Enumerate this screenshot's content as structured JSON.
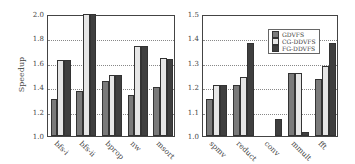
{
  "chart_data": [
    {
      "type": "bar",
      "title": "",
      "xlabel": "",
      "ylabel": "Speedup",
      "ylim": [
        1.0,
        2.0
      ],
      "yticks": [
        "1.0",
        "1.2",
        "1.4",
        "1.6",
        "1.8",
        "2.0"
      ],
      "grid": true,
      "categories": [
        "bfs-i",
        "bfs-ii",
        "bprop",
        "nw",
        "msort"
      ],
      "series": [
        {
          "name": "GDVFS",
          "color": "#7a7a7a",
          "values": [
            1.3,
            1.37,
            1.45,
            1.34,
            1.4
          ]
        },
        {
          "name": "CG-DDVFS",
          "color": "#e6e6e6",
          "values": [
            1.62,
            2.0,
            1.5,
            1.74,
            1.64
          ]
        },
        {
          "name": "FG-DDVFS",
          "color": "#3f3f3f",
          "values": [
            1.62,
            2.0,
            1.5,
            1.74,
            1.63
          ]
        }
      ]
    },
    {
      "type": "bar",
      "title": "",
      "xlabel": "",
      "ylabel": "",
      "ylim": [
        1.0,
        1.5
      ],
      "yticks": [
        "1.0",
        "1.1",
        "1.2",
        "1.3",
        "1.4",
        "1.5"
      ],
      "grid": true,
      "legend_position": "upper right",
      "categories": [
        "spmv",
        "reduct",
        "conv",
        "mmult",
        "fft"
      ],
      "series": [
        {
          "name": "GDVFS",
          "color": "#7a7a7a",
          "values": [
            1.15,
            1.21,
            1.0,
            1.26,
            1.235
          ]
        },
        {
          "name": "CG-DDVFS",
          "color": "#e6e6e6",
          "values": [
            1.21,
            1.24,
            1.0,
            1.26,
            1.285
          ]
        },
        {
          "name": "FG-DDVFS",
          "color": "#3f3f3f",
          "values": [
            1.21,
            1.38,
            1.07,
            1.015,
            1.38
          ]
        }
      ]
    }
  ],
  "legend": {
    "items": [
      {
        "label": "GDVFS",
        "color": "#7a7a7a"
      },
      {
        "label": "CG-DDVFS",
        "color": "#e6e6e6"
      },
      {
        "label": "FG-DDVFS",
        "color": "#3f3f3f"
      }
    ]
  }
}
